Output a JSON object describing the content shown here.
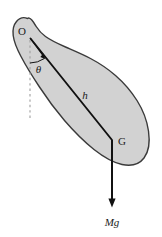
{
  "figure": {
    "type": "physics-free-body-diagram",
    "background_color": "#ffffff",
    "body_fill_color": "#d2d2d2",
    "body_outline_color": "#3a3a3a",
    "line_color": "#111111",
    "dashed_line_color": "#9a9a9a",
    "labels": {
      "pivot": "O",
      "angle": "θ",
      "distance": "h",
      "center_of_mass": "G",
      "force": "Mg"
    },
    "geometry": {
      "pivot_point": {
        "x": 30,
        "y": 37
      },
      "center_of_mass_point": {
        "x": 112,
        "y": 140
      },
      "force_arrow_tip": {
        "x": 112,
        "y": 206
      },
      "vertical_dashed_end": {
        "x": 30,
        "y": 119
      },
      "angle_arrow_end": {
        "x": 45,
        "y": 59
      },
      "angle_arc_radius_px": 26
    }
  }
}
